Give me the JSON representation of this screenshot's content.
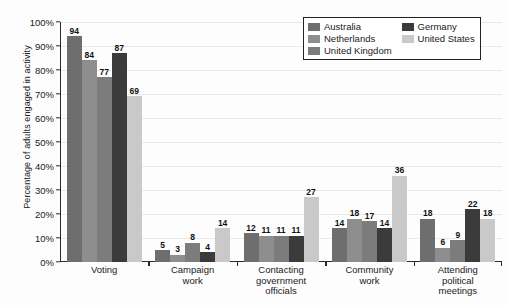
{
  "chart_data": {
    "type": "bar",
    "title": "",
    "xlabel": "",
    "ylabel": "Percentage of adults engaged in activity",
    "ylim": [
      0,
      100
    ],
    "ytick_labels": [
      "0%",
      "10%",
      "20%",
      "30%",
      "40%",
      "50%",
      "60%",
      "70%",
      "80%",
      "90%",
      "100%"
    ],
    "ytick_values": [
      0,
      10,
      20,
      30,
      40,
      50,
      60,
      70,
      80,
      90,
      100
    ],
    "grid": true,
    "legend_position": "top-right",
    "categories": [
      "Voting",
      "Campaign work",
      "Contacting government officials",
      "Community work",
      "Attending political meetings"
    ],
    "category_label_lines": [
      [
        "Voting"
      ],
      [
        "Campaign",
        "work"
      ],
      [
        "Contacting",
        "government",
        "officials"
      ],
      [
        "Community",
        "work"
      ],
      [
        "Attending",
        "political",
        "meetings"
      ]
    ],
    "series": [
      {
        "name": "Australia",
        "color": "#6e6e6e",
        "values": [
          94,
          5,
          12,
          14,
          18
        ]
      },
      {
        "name": "Netherlands",
        "color": "#8e8e8e",
        "values": [
          84,
          3,
          11,
          18,
          6
        ]
      },
      {
        "name": "United Kingdom",
        "color": "#7c7c7c",
        "values": [
          77,
          8,
          11,
          17,
          9
        ]
      },
      {
        "name": "Germany",
        "color": "#3b3b3b",
        "values": [
          87,
          4,
          11,
          14,
          22
        ]
      },
      {
        "name": "United States",
        "color": "#c9c9c9",
        "values": [
          69,
          14,
          27,
          36,
          18
        ]
      }
    ]
  }
}
